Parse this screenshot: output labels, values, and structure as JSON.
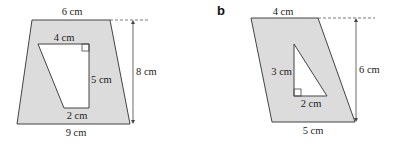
{
  "colors": {
    "shaded_fill": "#dcdcdc",
    "outline": "#444444",
    "hole_fill": "#ffffff"
  },
  "figures": [
    {
      "part_label": "",
      "outer_shape": "trapezium",
      "inner_shape": "trapezium",
      "labels": {
        "top": "6 cm",
        "bottom": "9 cm",
        "height": "8 cm",
        "inner_top": "4 cm",
        "inner_right": "5 cm",
        "inner_bottom": "2 cm"
      }
    },
    {
      "part_label": "b",
      "outer_shape": "parallelogram",
      "inner_shape": "right triangle",
      "labels": {
        "top": "4 cm",
        "bottom": "5 cm",
        "height": "6 cm",
        "inner_left": "3 cm",
        "inner_bottom": "2 cm"
      }
    }
  ]
}
